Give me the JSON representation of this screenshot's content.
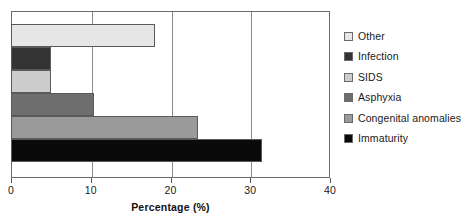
{
  "chart_data": {
    "type": "bar",
    "orientation": "horizontal",
    "title": "",
    "xlabel": "Percentage (%)",
    "ylabel": "",
    "xlim": [
      0,
      40
    ],
    "xticks": [
      0,
      10,
      20,
      30,
      40
    ],
    "xtick_labels": [
      "0",
      "10",
      "20",
      "30",
      "40"
    ],
    "grid": true,
    "grid_axis": "x",
    "legend_position": "right",
    "categories": [
      "Other",
      "Infection",
      "SIDS",
      "Asphyxia",
      "Congenital anomalies",
      "Immaturity"
    ],
    "values": [
      18.1,
      5.0,
      5.0,
      10.4,
      23.4,
      31.5
    ],
    "colors": [
      "#e6e6e6",
      "#333333",
      "#cccccc",
      "#6e6e6e",
      "#9a9a9a",
      "#0a0a0a"
    ],
    "series": [
      {
        "name": "Percentage",
        "points": [
          {
            "label": "Other",
            "value": 18.1,
            "color": "#e6e6e6"
          },
          {
            "label": "Infection",
            "value": 5.0,
            "color": "#333333"
          },
          {
            "label": "SIDS",
            "value": 5.0,
            "color": "#cccccc"
          },
          {
            "label": "Asphyxia",
            "value": 10.4,
            "color": "#6e6e6e"
          },
          {
            "label": "Congenital anomalies",
            "value": 23.4,
            "color": "#9a9a9a"
          },
          {
            "label": "Immaturity",
            "value": 31.5,
            "color": "#0a0a0a"
          }
        ]
      }
    ]
  },
  "legend": {
    "entries": [
      {
        "label": "Other",
        "color": "#e6e6e6"
      },
      {
        "label": "Infection",
        "color": "#333333"
      },
      {
        "label": "SIDS",
        "color": "#cccccc"
      },
      {
        "label": "Asphyxia",
        "color": "#6e6e6e"
      },
      {
        "label": "Congenital anomalies",
        "color": "#9a9a9a"
      },
      {
        "label": "Immaturity",
        "color": "#0a0a0a"
      }
    ]
  }
}
